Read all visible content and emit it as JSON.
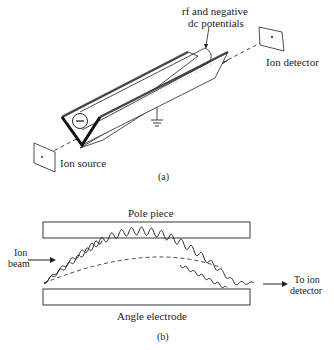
{
  "figure_a": {
    "caption": "(a)",
    "labels": {
      "potentials_line1": "rf and negative",
      "potentials_line2": "dc potentials",
      "ion_detector": "Ion detector",
      "ion_source": "Ion source"
    }
  },
  "figure_b": {
    "caption": "(b)",
    "labels": {
      "pole_piece": "Pole piece",
      "angle_electrode": "Angle electrode",
      "ion_beam_line1": "Ion",
      "ion_beam_line2": "beam",
      "to_detector_line1": "To ion",
      "to_detector_line2": "detector"
    }
  }
}
